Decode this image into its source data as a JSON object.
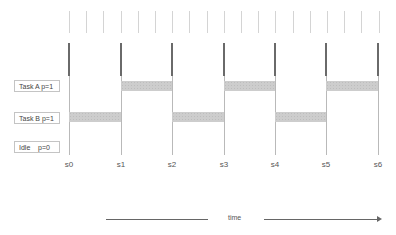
{
  "diagram": {
    "type": "task-schedule-timeline",
    "tasks": [
      {
        "label": "Task A p=1",
        "row": 0
      },
      {
        "label": "Task B p=1",
        "row": 1
      },
      {
        "label": "Idle    p=0",
        "row": 2
      }
    ],
    "slots": [
      "s0",
      "s1",
      "s2",
      "s3",
      "s4",
      "s5",
      "s6"
    ],
    "schedule": [
      {
        "task": "Task B",
        "from": "s0",
        "to": "s1"
      },
      {
        "task": "Task A",
        "from": "s1",
        "to": "s2"
      },
      {
        "task": "Task B",
        "from": "s2",
        "to": "s3"
      },
      {
        "task": "Task A",
        "from": "s3",
        "to": "s4"
      },
      {
        "task": "Task B",
        "from": "s4",
        "to": "s5"
      },
      {
        "task": "Task A",
        "from": "s5",
        "to": "s6"
      }
    ],
    "time_label": "time",
    "tick_count": 19
  },
  "colors": {
    "bar": "#cdcdcd",
    "slot_line_dark": "#6a6a6a",
    "slot_line_light": "#b9b9b9",
    "tick": "#d4d4d4",
    "arrow": "#666666"
  }
}
